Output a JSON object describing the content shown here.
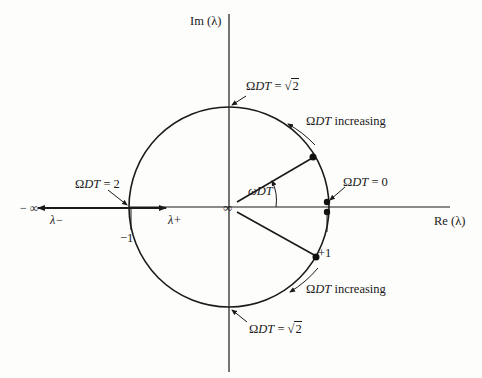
{
  "diagram": {
    "axes": {
      "imaginary_label": "Im (λ)",
      "real_label": "Re (λ)"
    },
    "labels": {
      "top": {
        "prefix": "Ω",
        "var": "DT",
        "eq": " = √",
        "val": "2"
      },
      "bottom": {
        "prefix": "Ω",
        "var": "DT",
        "eq": " = √",
        "val": "2"
      },
      "zero": {
        "prefix": "Ω",
        "var": "DT",
        "eq": " = 0"
      },
      "two": {
        "prefix": "Ω",
        "var": "DT",
        "eq": " = 2"
      },
      "increasing_upper": {
        "prefix": "Ω",
        "var": "DT",
        "suffix": " increasing"
      },
      "increasing_lower": {
        "prefix": "Ω",
        "var": "DT",
        "suffix": " increasing"
      },
      "angle": {
        "prefix": "ω",
        "var": "DT"
      },
      "origin": "∞",
      "neg_inf": "− ∞",
      "lambda_minus": "λ−",
      "lambda_plus": "λ+",
      "minus_one": "−1",
      "plus_one": "+1"
    },
    "geometry": {
      "center": [
        228,
        207
      ],
      "radius": 100,
      "line_color": "#1a1a1a",
      "background": "#fdfdfb"
    }
  }
}
